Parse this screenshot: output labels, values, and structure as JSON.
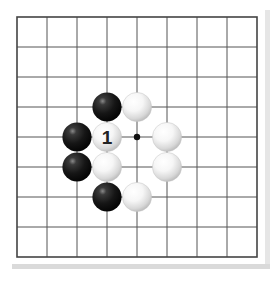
{
  "board": {
    "origin_x": 17,
    "origin_y": 17,
    "spacing": 30,
    "columns": 9,
    "rows": 9,
    "line_color": "#555555",
    "border_color": "#444444",
    "background": "#ffffff"
  },
  "stones": [
    {
      "color": "black",
      "col": 3,
      "row": 3
    },
    {
      "color": "white",
      "col": 4,
      "row": 3
    },
    {
      "color": "black",
      "col": 2,
      "row": 4
    },
    {
      "color": "white",
      "col": 3,
      "row": 4,
      "label": "1"
    },
    {
      "color": "white",
      "col": 5,
      "row": 4
    },
    {
      "color": "black",
      "col": 2,
      "row": 5
    },
    {
      "color": "white",
      "col": 3,
      "row": 5
    },
    {
      "color": "white",
      "col": 5,
      "row": 5
    },
    {
      "color": "black",
      "col": 3,
      "row": 6
    },
    {
      "color": "white",
      "col": 4,
      "row": 6
    }
  ],
  "markers": [
    {
      "type": "dot",
      "col": 4,
      "row": 4
    }
  ],
  "move_label": "1"
}
